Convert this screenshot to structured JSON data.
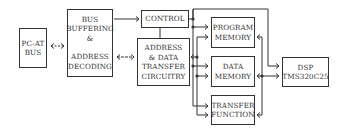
{
  "diagram": {
    "blocks": {
      "pc_at_bus": {
        "lines": [
          "PC-AT",
          "BUS"
        ]
      },
      "bus_buffering": {
        "lines": [
          "BUS",
          "BUFFERING",
          "&",
          "",
          "ADDRESS",
          "DECODING"
        ]
      },
      "control": {
        "lines": [
          "CONTROL"
        ]
      },
      "address_data": {
        "lines": [
          "ADDRESS",
          "& DATA",
          "TRANSFER",
          "CIRCUITRY"
        ]
      },
      "program_memory": {
        "lines": [
          "PROGRAM",
          "MEMORY"
        ]
      },
      "data_memory": {
        "lines": [
          "DATA",
          "MEMORY"
        ]
      },
      "transfer_function": {
        "lines": [
          "TRANSFER",
          "FUNCTION"
        ]
      },
      "dsp": {
        "lines": [
          "DSP",
          "TMS320C25"
        ]
      }
    },
    "connections": [
      {
        "from": "pc_at_bus",
        "to": "bus_buffering",
        "type": "bidirectional"
      },
      {
        "from": "bus_buffering",
        "to": "control",
        "type": "directed"
      },
      {
        "from": "bus_buffering",
        "to": "address_data",
        "type": "bidirectional"
      },
      {
        "from": "control",
        "to": "address_data",
        "type": "line"
      },
      {
        "from": "control",
        "to": "program_memory",
        "type": "directed"
      },
      {
        "from": "control",
        "to": "data_memory",
        "type": "directed"
      },
      {
        "from": "control",
        "to": "transfer_function",
        "type": "directed"
      },
      {
        "from": "control",
        "to": "dsp",
        "type": "directed"
      },
      {
        "from": "address_data",
        "to": "program_memory",
        "type": "directed"
      },
      {
        "from": "address_data",
        "to": "data_memory",
        "type": "directed"
      },
      {
        "from": "address_data",
        "to": "transfer_function",
        "type": "directed"
      },
      {
        "from": "dsp",
        "to": "program_memory",
        "type": "directed"
      },
      {
        "from": "dsp",
        "to": "data_memory",
        "type": "bidirectional"
      },
      {
        "from": "dsp",
        "to": "transfer_function",
        "type": "directed"
      }
    ],
    "colors": {
      "stroke": "#333333",
      "background": "#ffffff",
      "text": "#333333"
    }
  }
}
